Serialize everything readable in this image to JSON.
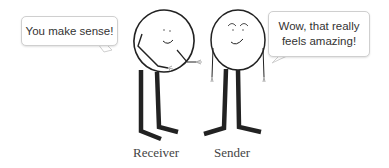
{
  "bubbles": {
    "receiver_speech": "You make sense!",
    "sender_speech_line1": "Wow, that really",
    "sender_speech_line2": "feels amazing!"
  },
  "labels": {
    "receiver": "Receiver",
    "sender": "Sender"
  },
  "colors": {
    "ink": "#222222",
    "bubble_border": "#cfcfcf",
    "text": "#333333"
  }
}
